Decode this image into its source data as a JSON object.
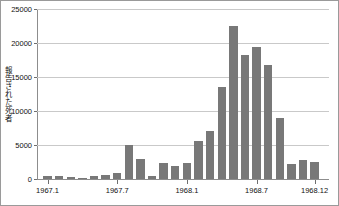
{
  "chart_data": {
    "type": "bar",
    "title": "",
    "subtitle": "",
    "xlabel": "",
    "ylabel": "報告された死者",
    "ylim": [
      0,
      25000
    ],
    "ytick_labels": [
      "0",
      "5000",
      "10000",
      "15000",
      "20000",
      "25000"
    ],
    "ytick_values": [
      0,
      5000,
      10000,
      15000,
      20000,
      25000
    ],
    "grid": true,
    "legend": null,
    "bar_color": "#787878",
    "grid_color": "#c9c9c9",
    "axis_color": "#8d8d8d",
    "categories": [
      "1967.1",
      "1967.2",
      "1967.3",
      "1967.4",
      "1967.5",
      "1967.6",
      "1967.7",
      "1967.8",
      "1967.9",
      "1967.10",
      "1967.11",
      "1967.12",
      "1968.1",
      "1968.2",
      "1968.3",
      "1968.4",
      "1968.5",
      "1968.6",
      "1968.7",
      "1968.8",
      "1968.9",
      "1968.10",
      "1968.11",
      "1968.12"
    ],
    "values": [
      400,
      400,
      250,
      200,
      450,
      600,
      900,
      5000,
      3000,
      400,
      2400,
      1900,
      2300,
      5600,
      7000,
      13500,
      22500,
      18200,
      19400,
      16700,
      8900,
      2200,
      2800,
      2500
    ],
    "xtick_labels": [
      "1967.1",
      "1967.7",
      "1968.1",
      "1968.7",
      "1968.12"
    ],
    "xtick_categories": [
      "1967.1",
      "1967.7",
      "1968.1",
      "1968.7",
      "1968.12"
    ]
  }
}
